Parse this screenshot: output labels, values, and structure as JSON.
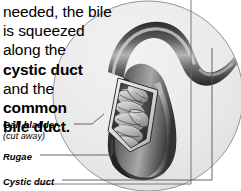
{
  "figure": {
    "kind": "anatomical-illustration",
    "style": "grayscale airbrush halftone inside circular frame",
    "frame_shape": "circle-with-rectangle-overlay"
  },
  "body_text": {
    "lines": [
      {
        "text": "needed, the bile",
        "bold": false
      },
      {
        "text": "is squeezed",
        "bold": false
      },
      {
        "text": "along the",
        "bold": false
      },
      {
        "text": "cystic duct",
        "bold": true
      },
      {
        "text": "and the",
        "bold": false
      },
      {
        "text": "common",
        "bold": true
      },
      {
        "text": "bile duct.",
        "bold": true
      }
    ],
    "full_text": "needed, the bile is squeezed along the cystic duct and the common bile duct."
  },
  "callouts": {
    "gall_bladder": "Gall bladder",
    "gall_bladder_sub": "(cut away)",
    "rugae": "Rugae",
    "cystic_duct": "Cystic duct"
  },
  "colors": {
    "text": "#000000",
    "page_background": "#ffffff",
    "circle_fill": "#e8e8e8",
    "circle_stroke": "#8a8a8a",
    "duct_dark": "#3a3a3a",
    "duct_mid": "#6e6e6e",
    "duct_light": "#cfcfcf",
    "rugae_light": "#d8d8d8",
    "rugae_shadow": "#4a4a4a",
    "leader_line": "#555555"
  }
}
